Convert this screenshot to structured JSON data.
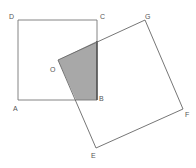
{
  "diagram": {
    "title": "",
    "colors": {
      "stroke": "#666666",
      "shade": "#a8a8a8",
      "bold_edge": "#444444"
    },
    "points": {
      "A": [
        18,
        100
      ],
      "B": [
        97,
        100
      ],
      "C": [
        97,
        20
      ],
      "D": [
        18,
        20
      ],
      "O": [
        58,
        60
      ],
      "E": [
        96,
        148
      ],
      "F": [
        183,
        109
      ],
      "G": [
        145,
        20
      ]
    },
    "labels": {
      "A": "A",
      "B": "B",
      "C": "C",
      "D": "D",
      "O": "O",
      "E": "E",
      "F": "F",
      "G": "G"
    },
    "shapes": [
      {
        "name": "square-ABCD",
        "vertices": [
          "A",
          "B",
          "C",
          "D"
        ]
      },
      {
        "name": "square-OEFG",
        "vertices": [
          "O",
          "E",
          "F",
          "G"
        ]
      }
    ],
    "shaded_region": "overlap of square ABCD and square OEFG"
  }
}
